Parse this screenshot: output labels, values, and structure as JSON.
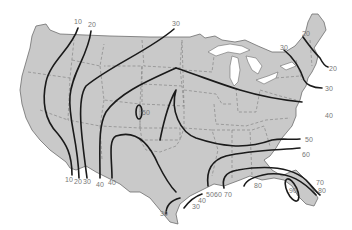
{
  "map": {
    "type": "isoline-map",
    "region": "Contiguous United States",
    "colors": {
      "land": "#c9c9c9",
      "isoline": "#1a1a1a",
      "label": "#777777",
      "background": "#ffffff"
    },
    "labels": {
      "nw_10": "10",
      "nw_20": "20",
      "n_30": "30",
      "ne_20a": "20",
      "ne_30a": "30",
      "ne_20b": "20",
      "ne_30b": "30",
      "e_40": "40",
      "e_50": "50",
      "se_60": "60",
      "se_70": "70",
      "se_80": "80",
      "gulf_80": "80",
      "fl_90": "90",
      "co_loop": "50",
      "sw_10": "10",
      "sw_20": "20",
      "sw_30": "30",
      "sw_40a": "40",
      "sw_40b": "40",
      "tx_30": "30",
      "tx_40": "40",
      "tx_30b": "30",
      "gulf_50": "50",
      "gulf_60": "60",
      "gulf_70": "70"
    }
  }
}
